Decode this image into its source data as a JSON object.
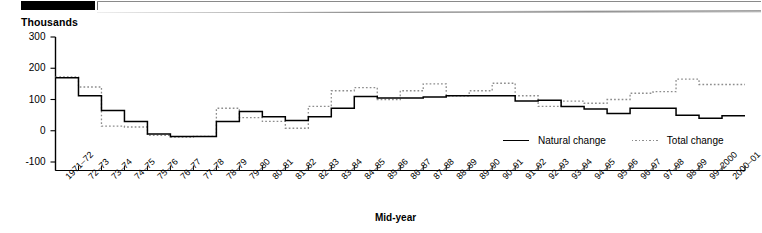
{
  "header": {
    "decor_block_name": "black-rule-block"
  },
  "axis_unit_label": "Thousands",
  "legend": {
    "items": [
      {
        "label": "Natural change",
        "style": "solid",
        "color": "#000000"
      },
      {
        "label": "Total change",
        "style": "dotted",
        "color": "#8d8d8d"
      }
    ]
  },
  "chart_data": {
    "type": "line",
    "title": "",
    "subtitle": "",
    "xlabel": "Mid-year",
    "ylabel": "Thousands",
    "ylim": [
      -100,
      300
    ],
    "yticks": [
      300,
      200,
      100,
      0,
      -100
    ],
    "grid": false,
    "legend_position": "inside-bottom-right",
    "step_style": "step-mid",
    "categories": [
      "1971–72",
      "72–73",
      "73–74",
      "74–75",
      "75–76",
      "76–77",
      "77–78",
      "78–79",
      "79–80",
      "80–81",
      "81–82",
      "82–83",
      "83–84",
      "84–85",
      "85–86",
      "86–87",
      "87–88",
      "88–89",
      "89–90",
      "90–91",
      "91–92",
      "92–93",
      "93–94",
      "94–95",
      "95–96",
      "96–97",
      "97–98",
      "98–99",
      "99–2000",
      "2000–01"
    ],
    "series": [
      {
        "name": "Natural change",
        "style": "solid",
        "color": "#000000",
        "values": [
          170,
          112,
          65,
          30,
          -10,
          -18,
          -18,
          30,
          62,
          45,
          33,
          45,
          72,
          110,
          105,
          105,
          108,
          112,
          112,
          112,
          95,
          98,
          78,
          70,
          55,
          72,
          72,
          50,
          40,
          48
        ]
      },
      {
        "name": "Total change",
        "style": "dotted",
        "color": "#8d8d8d",
        "values": [
          172,
          140,
          15,
          12,
          -15,
          -20,
          -18,
          72,
          42,
          30,
          8,
          78,
          128,
          138,
          100,
          128,
          150,
          112,
          128,
          152,
          112,
          78,
          95,
          88,
          100,
          120,
          125,
          165,
          148,
          148
        ]
      }
    ],
    "annotations": []
  }
}
